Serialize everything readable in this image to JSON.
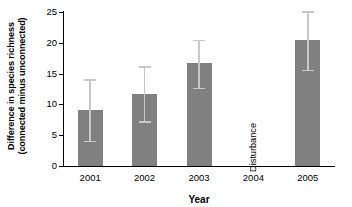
{
  "chart_data": {
    "type": "bar",
    "title": "",
    "xlabel": "Year",
    "ylabel_line1": "Difference in species richness",
    "ylabel_line2": "(connected minus unconnected)",
    "categories": [
      "2001",
      "2002",
      "2003",
      "2004",
      "2005"
    ],
    "values": [
      9.1,
      11.7,
      16.8,
      null,
      20.5
    ],
    "error_low": [
      4.1,
      7.3,
      12.7,
      null,
      15.6
    ],
    "error_high": [
      14.1,
      16.2,
      20.5,
      null,
      25.1
    ],
    "ylim": [
      0,
      25
    ],
    "yticks": [
      0,
      5,
      10,
      15,
      20,
      25
    ],
    "ytick_labels": [
      "0",
      "5",
      "10",
      "15",
      "20",
      "25"
    ],
    "grid": false,
    "legend": "none",
    "annotations": [
      {
        "text": "Disturbance",
        "category": "2004",
        "orientation": "vertical"
      }
    ],
    "bar_color": "#808080",
    "error_color": "#c8c8c8",
    "axis_color": "#000000",
    "background": "#ffffff"
  }
}
